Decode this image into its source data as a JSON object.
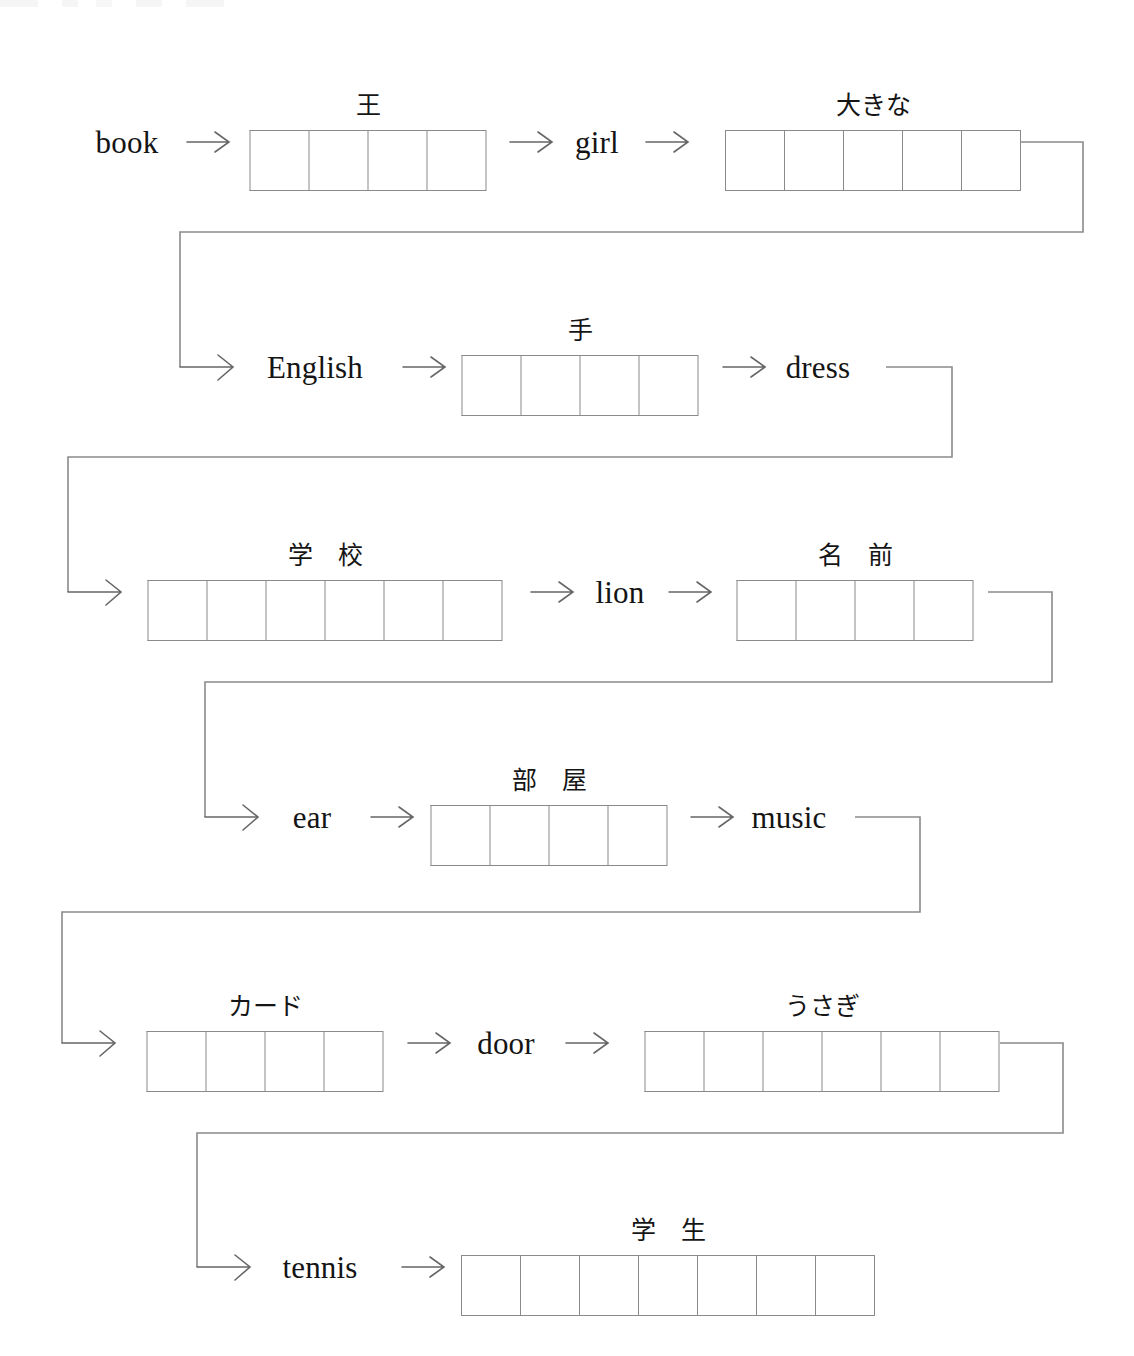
{
  "worksheet": {
    "title": "Japanese vocabulary chain worksheet",
    "line_color": "#8a8a8a",
    "text_color": "#141414",
    "arrow_color": "#555555"
  },
  "chain": [
    {
      "index": 0,
      "kind": "word",
      "name": "word-book",
      "text": "book"
    },
    {
      "index": 1,
      "kind": "arrow",
      "name": "arrow-book-to-ou",
      "text": "→"
    },
    {
      "index": 2,
      "kind": "answer-box",
      "name": "answer-box-ou",
      "label": "王",
      "cells": 4
    },
    {
      "index": 3,
      "kind": "arrow",
      "name": "arrow-ou-to-girl",
      "text": "→"
    },
    {
      "index": 4,
      "kind": "word",
      "name": "word-girl",
      "text": "girl"
    },
    {
      "index": 5,
      "kind": "arrow",
      "name": "arrow-girl-to-ookina",
      "text": "→"
    },
    {
      "index": 6,
      "kind": "answer-box",
      "name": "answer-box-ookina",
      "label": "大きな",
      "cells": 5
    },
    {
      "index": 7,
      "kind": "word",
      "name": "word-english",
      "text": "English"
    },
    {
      "index": 8,
      "kind": "arrow",
      "name": "arrow-english-to-te",
      "text": "→"
    },
    {
      "index": 9,
      "kind": "answer-box",
      "name": "answer-box-te",
      "label": "手",
      "cells": 4
    },
    {
      "index": 10,
      "kind": "arrow",
      "name": "arrow-te-to-dress",
      "text": "→"
    },
    {
      "index": 11,
      "kind": "word",
      "name": "word-dress",
      "text": "dress"
    },
    {
      "index": 12,
      "kind": "answer-box",
      "name": "answer-box-gakkou",
      "label": "学　校",
      "cells": 6
    },
    {
      "index": 13,
      "kind": "arrow",
      "name": "arrow-gakkou-to-lion",
      "text": "→"
    },
    {
      "index": 14,
      "kind": "word",
      "name": "word-lion",
      "text": "lion"
    },
    {
      "index": 15,
      "kind": "arrow",
      "name": "arrow-lion-to-namae",
      "text": "→"
    },
    {
      "index": 16,
      "kind": "answer-box",
      "name": "answer-box-namae",
      "label": "名　前",
      "cells": 4
    },
    {
      "index": 17,
      "kind": "word",
      "name": "word-ear",
      "text": "ear"
    },
    {
      "index": 18,
      "kind": "arrow",
      "name": "arrow-ear-to-heya",
      "text": "→"
    },
    {
      "index": 19,
      "kind": "answer-box",
      "name": "answer-box-heya",
      "label": "部　屋",
      "cells": 4
    },
    {
      "index": 20,
      "kind": "arrow",
      "name": "arrow-heya-to-music",
      "text": "→"
    },
    {
      "index": 21,
      "kind": "word",
      "name": "word-music",
      "text": "music"
    },
    {
      "index": 22,
      "kind": "answer-box",
      "name": "answer-box-kaado",
      "label": "カード",
      "cells": 4
    },
    {
      "index": 23,
      "kind": "arrow",
      "name": "arrow-kaado-to-door",
      "text": "→"
    },
    {
      "index": 24,
      "kind": "word",
      "name": "word-door",
      "text": "door"
    },
    {
      "index": 25,
      "kind": "arrow",
      "name": "arrow-door-to-usagi",
      "text": "→"
    },
    {
      "index": 26,
      "kind": "answer-box",
      "name": "answer-box-usagi",
      "label": "うさぎ",
      "cells": 6
    },
    {
      "index": 27,
      "kind": "word",
      "name": "word-tennis",
      "text": "tennis"
    },
    {
      "index": 28,
      "kind": "arrow",
      "name": "arrow-tennis-to-gakusei",
      "text": "→"
    },
    {
      "index": 29,
      "kind": "answer-box",
      "name": "answer-box-gakusei",
      "label": "学　生",
      "cells": 7
    }
  ],
  "rows": [
    {
      "name": "row-1",
      "items": [
        "book",
        "王",
        "girl",
        "大きな"
      ]
    },
    {
      "name": "row-2",
      "items": [
        "English",
        "手",
        "dress"
      ]
    },
    {
      "name": "row-3",
      "items": [
        "学　校",
        "lion",
        "名　前"
      ]
    },
    {
      "name": "row-4",
      "items": [
        "ear",
        "部　屋",
        "music"
      ]
    },
    {
      "name": "row-5",
      "items": [
        "カード",
        "door",
        "うさぎ"
      ]
    },
    {
      "name": "row-6",
      "items": [
        "tennis",
        "学　生"
      ]
    }
  ],
  "connectors": [
    {
      "name": "connector-row1-to-row2",
      "from": "大きな",
      "to": "English"
    },
    {
      "name": "connector-row2-to-row3",
      "from": "dress",
      "to": "学　校"
    },
    {
      "name": "connector-row3-to-row4",
      "from": "名　前",
      "to": "ear"
    },
    {
      "name": "connector-row4-to-row5",
      "from": "music",
      "to": "カード"
    },
    {
      "name": "connector-row5-to-row6",
      "from": "うさぎ",
      "to": "tennis"
    }
  ]
}
